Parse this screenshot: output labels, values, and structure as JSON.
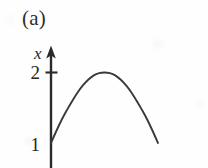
{
  "figure": {
    "panel_label": "(a)",
    "axis": {
      "vertical_label": "x",
      "vertical_label_name": "x-axis-label",
      "arrow_direction": "up"
    },
    "ticks": [
      {
        "label": "2",
        "value": 2,
        "has_tick_mark": true
      },
      {
        "label": "1",
        "value": 1,
        "has_tick_mark": false
      }
    ],
    "colors": {
      "stroke": "#3a3a3a",
      "axis": "#2b2b2b",
      "text": "#262626",
      "background": "#fefefe"
    }
  },
  "chart_data": {
    "type": "line",
    "title": "(a)",
    "xlabel": "",
    "ylabel": "x",
    "grid": false,
    "legend": null,
    "ylim": [
      0,
      2.45
    ],
    "xlim": [
      0,
      5.2
    ],
    "ytick_labels": [
      "1",
      "2"
    ],
    "ytick_values": [
      1,
      2
    ],
    "xtick_labels": [],
    "annotations": [],
    "series": [
      {
        "name": "x(t)",
        "comment": "concave curve starting at x=1, peaking near x=2, falling back toward x=1",
        "x": [
          0.0,
          0.25,
          0.5,
          0.75,
          1.0,
          1.25,
          1.5,
          1.75,
          2.0,
          2.25,
          2.5,
          2.75,
          3.0,
          3.25,
          3.5,
          3.75,
          4.0,
          4.25,
          4.5,
          4.75,
          5.0
        ],
        "y": [
          1.0,
          1.17,
          1.33,
          1.47,
          1.6,
          1.72,
          1.82,
          1.9,
          1.96,
          1.99,
          2.0,
          1.99,
          1.96,
          1.9,
          1.82,
          1.72,
          1.6,
          1.47,
          1.33,
          1.17,
          1.0
        ]
      }
    ]
  }
}
